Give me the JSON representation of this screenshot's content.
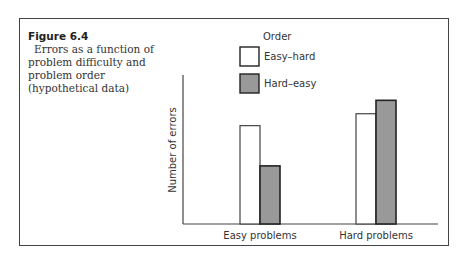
{
  "caption": {
    "figure_label": "Figure 6.4",
    "description": "Errors as a function of problem difficulty and problem order (hypothetical data)"
  },
  "chart_data": {
    "type": "bar",
    "title": "Errors as a function of problem difficulty and problem order (hypothetical data)",
    "xlabel": "",
    "ylabel": "Number of errors",
    "categories": [
      "Easy problems",
      "Hard problems"
    ],
    "legend": {
      "title": "Order",
      "placement": "top-right"
    },
    "series": [
      {
        "name": "Easy–hard",
        "color": "#ffffff",
        "values": [
          66,
          74
        ]
      },
      {
        "name": "Hard–easy",
        "color": "#999999",
        "values": [
          39,
          83
        ]
      }
    ],
    "ylim": [
      0,
      100
    ],
    "yticks": [],
    "grid": false,
    "units_note": "relative (hypothetical), no tick values shown"
  }
}
